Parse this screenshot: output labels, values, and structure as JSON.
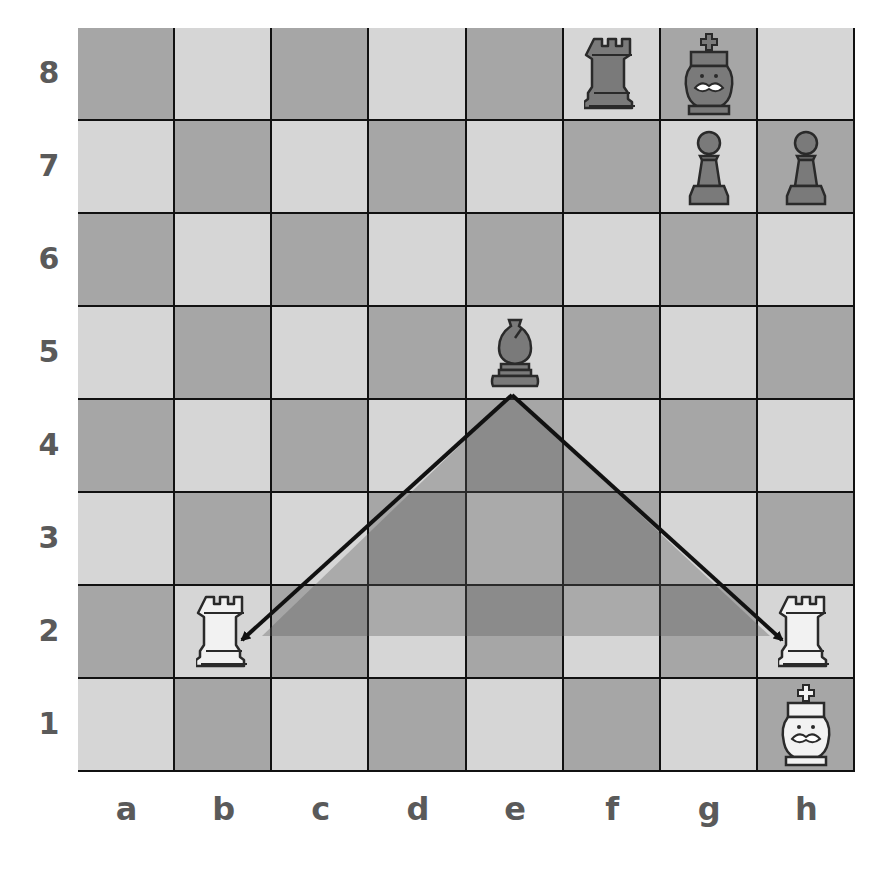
{
  "board": {
    "files": [
      "a",
      "b",
      "c",
      "d",
      "e",
      "f",
      "g",
      "h"
    ],
    "ranks": [
      "8",
      "7",
      "6",
      "5",
      "4",
      "3",
      "2",
      "1"
    ],
    "colors": {
      "light": "#d6d6d6",
      "dark": "#a6a6a6",
      "grid": "#111111",
      "label": "#5a5a5a"
    }
  },
  "pieces": [
    {
      "square": "f8",
      "type": "rook",
      "color": "black"
    },
    {
      "square": "g8",
      "type": "king",
      "color": "black"
    },
    {
      "square": "g7",
      "type": "pawn",
      "color": "black"
    },
    {
      "square": "h7",
      "type": "pawn",
      "color": "black"
    },
    {
      "square": "e5",
      "type": "bishop",
      "color": "black"
    },
    {
      "square": "b2",
      "type": "rook",
      "color": "white"
    },
    {
      "square": "h2",
      "type": "rook",
      "color": "white"
    },
    {
      "square": "h1",
      "type": "king",
      "color": "white"
    }
  ],
  "arrows": [
    {
      "from": "e5",
      "to": "b2",
      "meaning": "bishop attacks rook b2"
    },
    {
      "from": "e5",
      "to": "h2",
      "meaning": "bishop attacks rook h2"
    }
  ],
  "highlight": {
    "shape": "triangle",
    "between": [
      "b2",
      "e5",
      "h2"
    ],
    "color": "rgba(90,90,90,0.35)"
  }
}
